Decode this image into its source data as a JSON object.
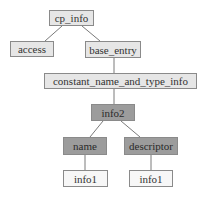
{
  "diagram": {
    "type": "tree",
    "nodes": [
      {
        "id": "cp_info",
        "label": "cp_info",
        "style": "light",
        "x": 49,
        "y": 10,
        "w": 45,
        "h": 16
      },
      {
        "id": "access",
        "label": "access",
        "style": "light",
        "x": 10,
        "y": 41,
        "w": 44,
        "h": 16
      },
      {
        "id": "base_entry",
        "label": "base_entry",
        "style": "light",
        "x": 85,
        "y": 41,
        "w": 56,
        "h": 17
      },
      {
        "id": "constant",
        "label": "constant_name_and_type_info",
        "style": "light",
        "x": 44,
        "y": 73,
        "w": 153,
        "h": 16
      },
      {
        "id": "info2",
        "label": "info2",
        "style": "dark",
        "x": 91,
        "y": 104,
        "w": 44,
        "h": 17
      },
      {
        "id": "name",
        "label": "name",
        "style": "dark",
        "x": 63,
        "y": 137,
        "w": 44,
        "h": 18
      },
      {
        "id": "descriptor",
        "label": "descriptor",
        "style": "dark",
        "x": 124,
        "y": 137,
        "w": 54,
        "h": 18
      },
      {
        "id": "info1_a",
        "label": "info1",
        "style": "white",
        "x": 63,
        "y": 170,
        "w": 45,
        "h": 17
      },
      {
        "id": "info1_b",
        "label": "info1",
        "style": "white",
        "x": 129,
        "y": 170,
        "w": 44,
        "h": 17
      }
    ],
    "edges": [
      {
        "from": "cp_info",
        "to": "access",
        "x1": 62,
        "y1": 26,
        "x2": 45,
        "y2": 41
      },
      {
        "from": "cp_info",
        "to": "base_entry",
        "x1": 82,
        "y1": 26,
        "x2": 100,
        "y2": 41
      },
      {
        "from": "base_entry",
        "to": "constant",
        "x1": 114,
        "y1": 58,
        "x2": 114,
        "y2": 73
      },
      {
        "from": "constant",
        "to": "info2",
        "x1": 114,
        "y1": 89,
        "x2": 114,
        "y2": 104
      },
      {
        "from": "info2",
        "to": "name",
        "x1": 103,
        "y1": 121,
        "x2": 90,
        "y2": 137
      },
      {
        "from": "info2",
        "to": "descriptor",
        "x1": 121,
        "y1": 121,
        "x2": 140,
        "y2": 137
      },
      {
        "from": "name",
        "to": "info1_a",
        "x1": 85,
        "y1": 155,
        "x2": 85,
        "y2": 170
      },
      {
        "from": "descriptor",
        "to": "info1_b",
        "x1": 151,
        "y1": 155,
        "x2": 151,
        "y2": 170
      }
    ],
    "colors": {
      "light": "#e6e6e6",
      "dark": "#9c9c9c",
      "white": "#f7f7f7",
      "border": "#8a8a8a",
      "edge": "#7a7a7a"
    }
  }
}
